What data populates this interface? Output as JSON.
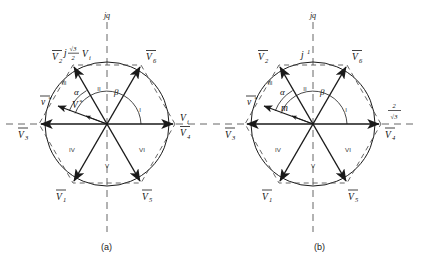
{
  "figure": {
    "type": "space-vector-hexagon-diagram",
    "panels": [
      {
        "id": "a",
        "caption": "(a)",
        "axis_label_vertical": "jq",
        "axis_label_top_annotation": "j",
        "axis_top_fraction_numerator": "√3",
        "axis_top_fraction_denominator": "2",
        "axis_top_suffix": "V",
        "axis_top_suffix_sub": "i",
        "right_axis_label": "V",
        "right_axis_label_sub": "i",
        "reference_vector_label": "v",
        "reference_vector_star": "*",
        "reference_magnitude_label": "V",
        "reference_magnitude_star": "*",
        "angle_alpha": "α",
        "angle_beta": "β",
        "vectors": [
          {
            "name": "V",
            "sub": "4",
            "angle_deg": 0
          },
          {
            "name": "V",
            "sub": "6",
            "angle_deg": 60
          },
          {
            "name": "V",
            "sub": "2",
            "angle_deg": 120
          },
          {
            "name": "V",
            "sub": "3",
            "angle_deg": 180
          },
          {
            "name": "V",
            "sub": "1",
            "angle_deg": 240
          },
          {
            "name": "V",
            "sub": "5",
            "angle_deg": 300
          }
        ],
        "sectors": [
          "I",
          "II",
          "III",
          "IV",
          "V",
          "VI"
        ]
      },
      {
        "id": "b",
        "caption": "(b)",
        "axis_label_vertical": "jq",
        "axis_label_top_annotation": "j",
        "axis_top_value": "1",
        "right_axis_fraction_numerator": "2",
        "right_axis_fraction_denominator": "√3",
        "reference_vector_label": "v",
        "reference_vector_star": "*",
        "reference_magnitude_label": "m",
        "angle_alpha": "α",
        "angle_beta": "β",
        "vectors": [
          {
            "name": "V",
            "sub": "4",
            "angle_deg": 0
          },
          {
            "name": "V",
            "sub": "6",
            "angle_deg": 60
          },
          {
            "name": "V",
            "sub": "2",
            "angle_deg": 120
          },
          {
            "name": "V",
            "sub": "3",
            "angle_deg": 180
          },
          {
            "name": "V",
            "sub": "1",
            "angle_deg": 240
          },
          {
            "name": "V",
            "sub": "5",
            "angle_deg": 300
          }
        ],
        "sectors": [
          "I",
          "II",
          "III",
          "IV",
          "V",
          "VI"
        ]
      }
    ],
    "geometry": {
      "center_x": 107,
      "center_y": 124,
      "hexagon_radius": 68,
      "circle_radius": 62,
      "reference_vector_angle_deg": 160,
      "reference_vector_length": 52
    },
    "colors": {
      "stroke": "#1a1a1a",
      "dashed": "#555555",
      "text": "#111111"
    }
  }
}
